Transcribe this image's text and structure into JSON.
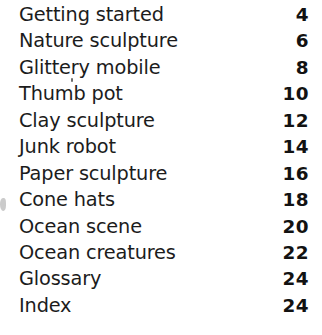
{
  "page": {
    "kind": "table-of-contents",
    "background_color": "#ffffff",
    "text_color": "#1a1a1a"
  },
  "contents": {
    "entries": [
      {
        "title": "Getting started",
        "page": "4"
      },
      {
        "title": "Nature sculpture",
        "page": "6"
      },
      {
        "title": "Glittery mobile",
        "page": "8"
      },
      {
        "title": "Thumb pot",
        "page": "10"
      },
      {
        "title": "Clay sculpture",
        "page": "12"
      },
      {
        "title": "Junk robot",
        "page": "14"
      },
      {
        "title": "Paper sculpture",
        "page": "16"
      },
      {
        "title": "Cone hats",
        "page": "18"
      },
      {
        "title": "Ocean scene",
        "page": "20"
      },
      {
        "title": "Ocean creatures",
        "page": "22"
      },
      {
        "title": "Glossary",
        "page": "24"
      },
      {
        "title": "Index",
        "page": "24"
      }
    ]
  }
}
